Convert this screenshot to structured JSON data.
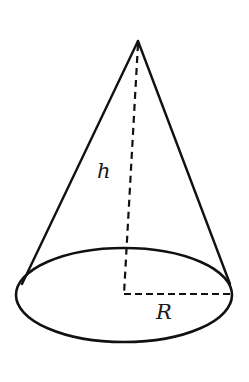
{
  "diagram": {
    "type": "cone",
    "labels": {
      "height": "h",
      "radius": "R"
    },
    "colors": {
      "stroke": "#111111",
      "background": "#ffffff"
    }
  }
}
